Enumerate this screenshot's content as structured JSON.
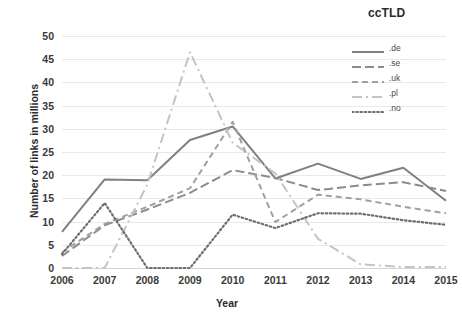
{
  "chart_data": {
    "type": "line",
    "title": "ccTLD",
    "subtitle": "",
    "xlabel": "Year",
    "ylabel": "Number of links in millions",
    "x": [
      "2006",
      "2007",
      "2008",
      "2009",
      "2010",
      "2011",
      "2012",
      "2013",
      "2014",
      "2015"
    ],
    "categories": [
      "2006",
      "2007",
      "2008",
      "2009",
      "2010",
      "2011",
      "2012",
      "2013",
      "2014",
      "2015"
    ],
    "xlim": [
      2006,
      2015
    ],
    "ylim": [
      0,
      50
    ],
    "ytick_labels": [
      "0",
      "5",
      "10",
      "15",
      "20",
      "25",
      "30",
      "35",
      "40",
      "45",
      "50"
    ],
    "ytick_values": [
      0,
      5,
      10,
      15,
      20,
      25,
      30,
      35,
      40,
      45,
      50
    ],
    "grid": "horizontal",
    "legend_position": "top-right",
    "series": [
      {
        "name": ".de",
        "values": [
          7.8,
          19.1,
          18.9,
          27.6,
          30.5,
          19.3,
          22.5,
          19.2,
          21.6,
          14.5
        ],
        "color": "#808080",
        "style": "solid"
      },
      {
        "name": ".se",
        "values": [
          2.6,
          9.2,
          12.6,
          16.2,
          21.1,
          19.4,
          16.8,
          17.8,
          18.5,
          16.6
        ],
        "color": "#8c8c8c",
        "style": "long-dash"
      },
      {
        "name": ".uk",
        "values": [
          3.4,
          9.5,
          13.2,
          17.2,
          31.5,
          9.9,
          15.8,
          14.8,
          13.2,
          11.8
        ],
        "color": "#a0a0a0",
        "style": "dash"
      },
      {
        "name": ".pl",
        "values": [
          0.0,
          0.0,
          18.0,
          46.5,
          27.0,
          20.4,
          6.3,
          0.8,
          0.2,
          0.2
        ],
        "color": "#c4c4c4",
        "style": "dash-dot"
      },
      {
        "name": ".no",
        "values": [
          3.0,
          14.0,
          0.0,
          0.0,
          11.5,
          8.6,
          11.8,
          11.7,
          10.3,
          9.3
        ],
        "color": "#6e6e6e",
        "style": "dot"
      }
    ]
  },
  "legend": {
    "items": [
      {
        "label": ".de"
      },
      {
        "label": ".se"
      },
      {
        "label": ".uk"
      },
      {
        "label": ".pl"
      },
      {
        "label": ".no"
      }
    ]
  }
}
